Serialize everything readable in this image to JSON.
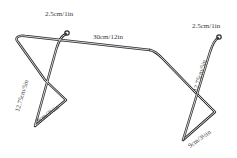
{
  "dimensions": {
    "left_hook": "2.5cm/1in",
    "right_hook": "2.5cm/1in",
    "bar_length": "30cm/12in",
    "left_leg_height": "12.75cm/5in",
    "right_leg_height": "12.75cm/5in",
    "left_foot": "9cm/3½in",
    "right_foot": "9cm/3½in"
  },
  "colors": {
    "wire": "#2a2a2a",
    "label": "#3a3a3a",
    "background": "#ffffff"
  }
}
